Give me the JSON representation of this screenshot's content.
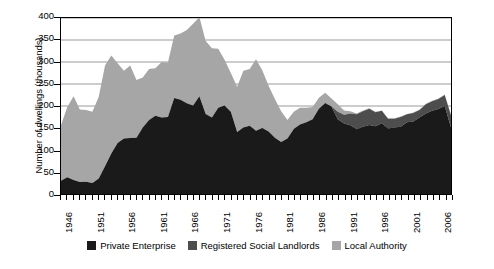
{
  "chart_data": {
    "type": "area",
    "stacked": true,
    "title": "",
    "xlabel": "",
    "ylabel": "Number of dwellings (thousands)",
    "ylim": [
      0,
      400
    ],
    "ytick_values": [
      0,
      50,
      100,
      150,
      200,
      250,
      300,
      350,
      400
    ],
    "ytick_labels": [
      "0",
      "50",
      "100",
      "150",
      "200",
      "250",
      "300",
      "350",
      "400"
    ],
    "grid": true,
    "grid_axis": "y",
    "legend_position": "bottom",
    "xlim": [
      1946,
      2008
    ],
    "x_tick_step": 1,
    "x_label_step": 5,
    "x_label_years": [
      1946,
      1951,
      1956,
      1961,
      1966,
      1971,
      1976,
      1981,
      1986,
      1991,
      1996,
      2001,
      2006
    ],
    "x": [
      1946,
      1947,
      1948,
      1949,
      1950,
      1951,
      1952,
      1953,
      1954,
      1955,
      1956,
      1957,
      1958,
      1959,
      1960,
      1961,
      1962,
      1963,
      1964,
      1965,
      1966,
      1967,
      1968,
      1969,
      1970,
      1971,
      1972,
      1973,
      1974,
      1975,
      1976,
      1977,
      1978,
      1979,
      1980,
      1981,
      1982,
      1983,
      1984,
      1985,
      1986,
      1987,
      1988,
      1989,
      1990,
      1991,
      1992,
      1993,
      1994,
      1995,
      1996,
      1997,
      1998,
      1999,
      2000,
      2001,
      2002,
      2003,
      2004,
      2005,
      2006,
      2007,
      2008
    ],
    "series": [
      {
        "name": "Private Enterprise",
        "color": "#1a1a1a",
        "values": [
          30,
          38,
          32,
          27,
          28,
          25,
          35,
          63,
          92,
          116,
          126,
          127,
          128,
          151,
          168,
          178,
          174,
          175,
          218,
          214,
          206,
          201,
          222,
          182,
          174,
          196,
          201,
          187,
          141,
          151,
          155,
          144,
          150,
          142,
          128,
          118,
          126,
          148,
          158,
          163,
          170,
          194,
          207,
          199,
          170,
          160,
          156,
          147,
          153,
          157,
          154,
          161,
          149,
          151,
          153,
          163,
          165,
          174,
          183,
          189,
          193,
          200,
          151
        ]
      },
      {
        "name": "Registered Social Landlords",
        "color": "#4d4d4d",
        "values": [
          0,
          0,
          0,
          0,
          0,
          0,
          0,
          0,
          0,
          0,
          0,
          0,
          0,
          0,
          0,
          0,
          0,
          0,
          0,
          0,
          0,
          0,
          0,
          0,
          0,
          0,
          0,
          0,
          0,
          0,
          0,
          0,
          0,
          0,
          0,
          0,
          0,
          0,
          0,
          0,
          0,
          0,
          0,
          0,
          17,
          20,
          27,
          34,
          35,
          37,
          32,
          28,
          22,
          20,
          22,
          18,
          19,
          17,
          21,
          22,
          23,
          25,
          28
        ]
      },
      {
        "name": "Local Authority",
        "color": "#a6a6a6",
        "values": [
          126,
          160,
          190,
          165,
          163,
          162,
          186,
          229,
          223,
          181,
          154,
          165,
          131,
          114,
          116,
          108,
          126,
          124,
          142,
          151,
          167,
          186,
          180,
          166,
          157,
          134,
          104,
          88,
          103,
          129,
          129,
          162,
          131,
          104,
          88,
          70,
          42,
          39,
          38,
          33,
          28,
          25,
          23,
          18,
          17,
          10,
          5,
          2,
          2,
          1,
          1,
          1,
          1,
          1,
          1,
          1,
          1,
          1,
          1,
          1,
          1,
          1,
          1
        ]
      }
    ]
  },
  "legend": {
    "items": [
      {
        "label": "Private Enterprise",
        "color": "#1a1a1a"
      },
      {
        "label": "Registered Social Landlords",
        "color": "#4d4d4d"
      },
      {
        "label": "Local Authority",
        "color": "#a6a6a6"
      }
    ]
  },
  "axis": {
    "y_title": "Number of dwellings (thousands)"
  },
  "colors": {
    "plot_border": "#000000",
    "gridline": "#808080",
    "background": "#ffffff"
  }
}
